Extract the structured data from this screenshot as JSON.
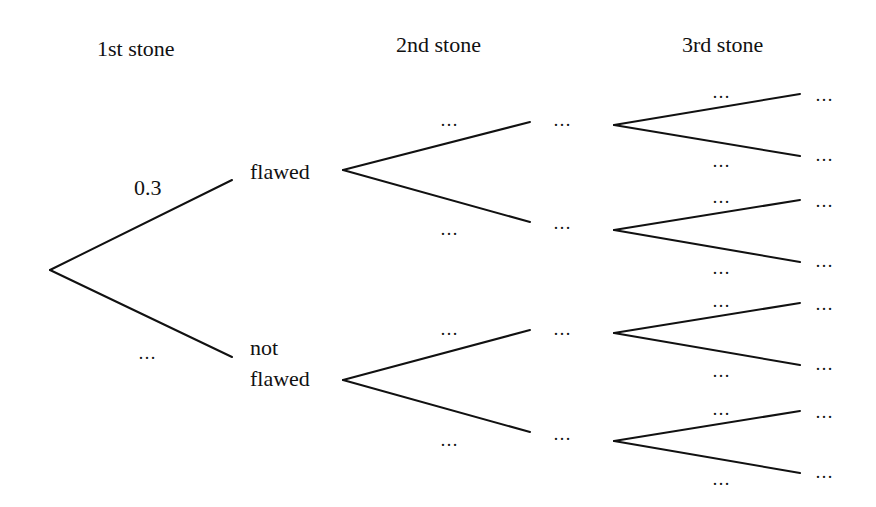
{
  "headers": {
    "stone1": "1st stone",
    "stone2": "2nd stone",
    "stone3": "3rd stone"
  },
  "branches": {
    "root_upper_prob": "0.3",
    "root_lower_prob": "…",
    "upper_outcome": "flawed",
    "lower_outcome_line1": "not",
    "lower_outcome_line2": "flawed"
  },
  "level2": {
    "labels": [
      "…",
      "…",
      "…",
      "…"
    ],
    "outcomes": [
      "…",
      "…",
      "…",
      "…"
    ]
  },
  "level3": {
    "labels": [
      "…",
      "…",
      "…",
      "…",
      "…",
      "…",
      "…",
      "…"
    ],
    "outcomes": [
      "…",
      "…",
      "…",
      "…",
      "…",
      "…",
      "…",
      "…"
    ]
  },
  "colors": {
    "line": "#111111",
    "background": "#ffffff"
  }
}
